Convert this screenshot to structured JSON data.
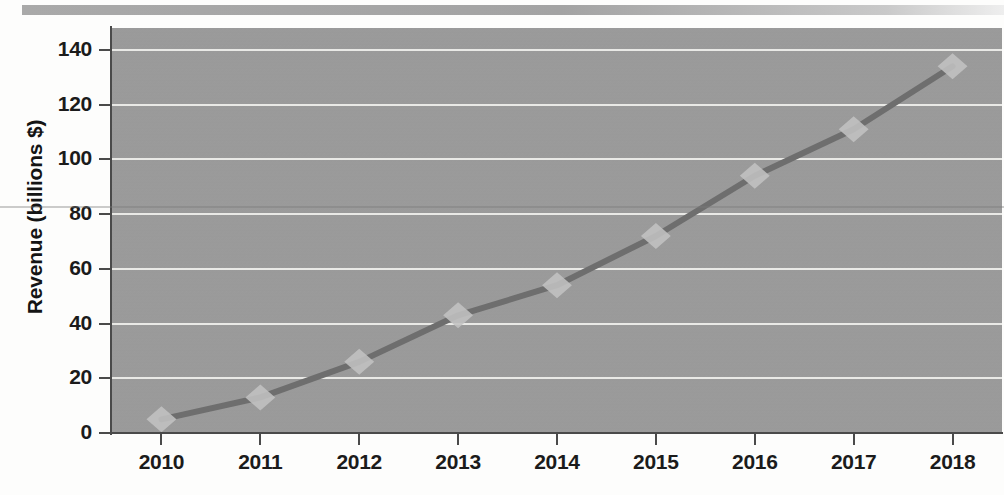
{
  "figure": {
    "background_color": "#fdfdfc",
    "plot_background_color": "#9c9c9c",
    "gridline_color": "#e9e9e6",
    "axis_color": "#4a4a4a",
    "series_color": "#6e6e6e",
    "marker_color": "#c2c2c2",
    "header_band_color": "#a9a9a9"
  },
  "chart_data": {
    "type": "line",
    "title": "",
    "subtitle": "",
    "xlabel": "",
    "ylabel": "Revenue (billions $)",
    "categories": [
      "2010",
      "2011",
      "2012",
      "2013",
      "2014",
      "2015",
      "2016",
      "2017",
      "2018"
    ],
    "x": [
      2010,
      2011,
      2012,
      2013,
      2014,
      2015,
      2016,
      2017,
      2018
    ],
    "values": [
      5,
      13,
      26,
      43,
      54,
      72,
      94,
      111,
      134
    ],
    "series": [
      {
        "name": "Revenue",
        "values": [
          5,
          13,
          26,
          43,
          54,
          72,
          94,
          111,
          134
        ],
        "marker": "diamond",
        "line_style": "solid"
      }
    ],
    "ylim": [
      0,
      148
    ],
    "xlim": [
      2009.5,
      2018.5
    ],
    "y_ticks": [
      0,
      20,
      40,
      60,
      80,
      100,
      120,
      140
    ],
    "y_tick_labels": [
      "0",
      "20",
      "40",
      "60",
      "80",
      "100",
      "120",
      "140"
    ],
    "x_tick_labels": [
      "2010",
      "2011",
      "2012",
      "2013",
      "2014",
      "2015",
      "2016",
      "2017",
      "2018"
    ],
    "grid": true,
    "grid_axis": "y",
    "legend": false,
    "legend_position": "none",
    "annotations": []
  }
}
